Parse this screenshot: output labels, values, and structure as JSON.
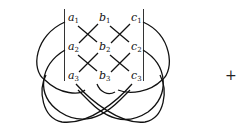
{
  "diagram": {
    "type": "knot-diagram",
    "labels": [
      {
        "id": "a1",
        "letter": "a",
        "sub": "1",
        "x": 68,
        "y": 21
      },
      {
        "id": "b1",
        "letter": "b",
        "sub": "1",
        "x": 99,
        "y": 21
      },
      {
        "id": "c1",
        "letter": "c",
        "sub": "1",
        "x": 131,
        "y": 21
      },
      {
        "id": "a2",
        "letter": "a",
        "sub": "2",
        "x": 68,
        "y": 50
      },
      {
        "id": "b2",
        "letter": "b",
        "sub": "2",
        "x": 99,
        "y": 50
      },
      {
        "id": "c2",
        "letter": "c",
        "sub": "2",
        "x": 131,
        "y": 50
      },
      {
        "id": "a3",
        "letter": "a",
        "sub": "3",
        "x": 68,
        "y": 79
      },
      {
        "id": "b3",
        "letter": "b",
        "sub": "3",
        "x": 99,
        "y": 79
      },
      {
        "id": "c3",
        "letter": "c",
        "sub": "3",
        "x": 131,
        "y": 79
      }
    ],
    "operator": "+"
  }
}
